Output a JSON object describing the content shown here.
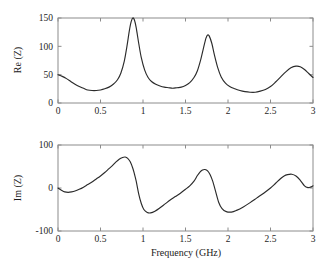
{
  "figure": {
    "background": "#ffffff",
    "curve_color": "#2b2b2b",
    "frame_color": "#8c8c8c"
  },
  "chart_data": [
    {
      "type": "line",
      "title": "",
      "xlabel": "",
      "ylabel": "Re (Z)",
      "xlim": [
        0,
        3
      ],
      "ylim": [
        0,
        150
      ],
      "xticks": [
        0,
        0.5,
        1,
        1.5,
        2,
        2.5,
        3
      ],
      "xticklabels": [
        "0",
        "0.5",
        "1",
        "1.5",
        "2",
        "2.5",
        "3"
      ],
      "yticks": [
        0,
        50,
        100,
        150
      ],
      "yticklabels": [
        "0",
        "50",
        "100",
        "150"
      ],
      "grid": false,
      "legend": null,
      "series": [
        {
          "name": "Re (Z)",
          "x": [
            0,
            0.05,
            0.1,
            0.15,
            0.2,
            0.25,
            0.3,
            0.35,
            0.4,
            0.45,
            0.5,
            0.55,
            0.6,
            0.65,
            0.7,
            0.74,
            0.78,
            0.81,
            0.84,
            0.86,
            0.88,
            0.9,
            0.92,
            0.95,
            0.98,
            1.02,
            1.06,
            1.1,
            1.15,
            1.2,
            1.25,
            1.3,
            1.35,
            1.4,
            1.45,
            1.5,
            1.55,
            1.6,
            1.64,
            1.68,
            1.71,
            1.74,
            1.76,
            1.78,
            1.81,
            1.84,
            1.88,
            1.92,
            1.97,
            2.02,
            2.08,
            2.14,
            2.2,
            2.26,
            2.32,
            2.38,
            2.44,
            2.5,
            2.56,
            2.62,
            2.68,
            2.74,
            2.8,
            2.85,
            2.9,
            2.95,
            3
          ],
          "y": [
            50,
            47,
            43,
            38,
            33,
            29,
            26,
            23,
            22,
            22,
            23,
            25,
            28,
            33,
            41,
            53,
            74,
            99,
            128,
            143,
            150,
            146,
            133,
            105,
            80,
            58,
            45,
            38,
            33,
            30,
            28,
            27,
            26,
            27,
            28,
            31,
            36,
            45,
            57,
            77,
            96,
            114,
            120,
            118,
            105,
            85,
            62,
            46,
            35,
            29,
            25,
            22,
            20,
            19,
            19,
            21,
            24,
            29,
            37,
            46,
            55,
            62,
            65,
            64,
            59,
            52,
            45
          ]
        }
      ]
    },
    {
      "type": "line",
      "title": "",
      "xlabel": "Frequency (GHz)",
      "ylabel": "Im (Z)",
      "xlim": [
        0,
        3
      ],
      "ylim": [
        -100,
        100
      ],
      "xticks": [
        0,
        0.5,
        1,
        1.5,
        2,
        2.5,
        3
      ],
      "xticklabels": [
        "0",
        "0.5",
        "1",
        "1.5",
        "2",
        "2.5",
        "3"
      ],
      "yticks": [
        -100,
        0,
        100
      ],
      "yticklabels": [
        "-100",
        "0",
        "100"
      ],
      "grid": false,
      "legend": null,
      "series": [
        {
          "name": "Im (Z)",
          "x": [
            0,
            0.04,
            0.08,
            0.12,
            0.16,
            0.2,
            0.25,
            0.3,
            0.35,
            0.4,
            0.45,
            0.5,
            0.55,
            0.6,
            0.64,
            0.68,
            0.72,
            0.76,
            0.79,
            0.82,
            0.85,
            0.88,
            0.9,
            0.92,
            0.95,
            0.98,
            1.01,
            1.05,
            1.09,
            1.14,
            1.2,
            1.26,
            1.32,
            1.38,
            1.44,
            1.5,
            1.55,
            1.6,
            1.64,
            1.67,
            1.7,
            1.73,
            1.76,
            1.79,
            1.82,
            1.85,
            1.89,
            1.93,
            1.98,
            2.04,
            2.1,
            2.18,
            2.26,
            2.34,
            2.42,
            2.5,
            2.56,
            2.62,
            2.66,
            2.7,
            2.75,
            2.8,
            2.85,
            2.9,
            2.94,
            2.97,
            3
          ],
          "y": [
            0,
            -5,
            -9,
            -10,
            -9,
            -7,
            -3,
            2,
            8,
            14,
            21,
            28,
            36,
            45,
            52,
            60,
            67,
            71,
            72,
            69,
            61,
            46,
            32,
            16,
            -14,
            -36,
            -50,
            -57,
            -58,
            -54,
            -46,
            -37,
            -28,
            -20,
            -12,
            -3,
            5,
            16,
            29,
            37,
            42,
            43,
            40,
            31,
            16,
            -5,
            -33,
            -48,
            -55,
            -56,
            -52,
            -44,
            -34,
            -23,
            -12,
            0,
            11,
            22,
            28,
            31,
            32,
            28,
            18,
            5,
            1,
            2,
            5
          ]
        }
      ]
    }
  ]
}
